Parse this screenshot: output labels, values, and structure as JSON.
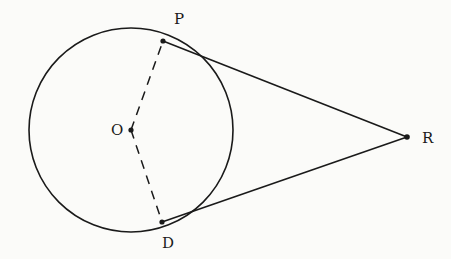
{
  "diagram": {
    "type": "circle-with-tangents",
    "circle": {
      "center_label": "O",
      "cx": 131,
      "cy": 130,
      "r": 102
    },
    "points": {
      "O": {
        "label": "O",
        "x": 131,
        "y": 130,
        "label_x": 111,
        "label_y": 135
      },
      "P": {
        "label": "P",
        "x": 163,
        "y": 41,
        "label_x": 174,
        "label_y": 24
      },
      "D": {
        "label": "D",
        "x": 162,
        "y": 222,
        "label_x": 162,
        "label_y": 248
      },
      "R": {
        "label": "R",
        "x": 407,
        "y": 137,
        "label_x": 422,
        "label_y": 143
      }
    },
    "segments": [
      {
        "from": "P",
        "to": "R",
        "style": "solid"
      },
      {
        "from": "D",
        "to": "R",
        "style": "solid"
      },
      {
        "from": "O",
        "to": "P",
        "style": "dashed"
      },
      {
        "from": "O",
        "to": "D",
        "style": "dashed"
      }
    ],
    "colors": {
      "ink": "#1a1a1a",
      "background": "#fbfbf9"
    }
  }
}
